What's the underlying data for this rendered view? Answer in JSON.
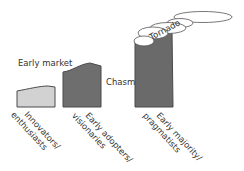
{
  "diagram": {
    "type": "technology-adoption-lifecycle-chasm",
    "labels": {
      "early_market": "Early market",
      "chasm": "Chasm",
      "tornado": "Tornado"
    },
    "segments": [
      {
        "line1": "Innovators/",
        "line2": "enthusiasts",
        "fill": "#d2d2d2"
      },
      {
        "line1": "Early adopters/",
        "line2": "visionaries",
        "fill": "#6e6e6e"
      },
      {
        "line1": "Early majority/",
        "line2": "pragmatists",
        "fill": "#6a6a6a"
      }
    ],
    "colors": {
      "outline": "#4a4a4a",
      "text": "#333333",
      "tornado_fill": "#ffffff"
    }
  }
}
